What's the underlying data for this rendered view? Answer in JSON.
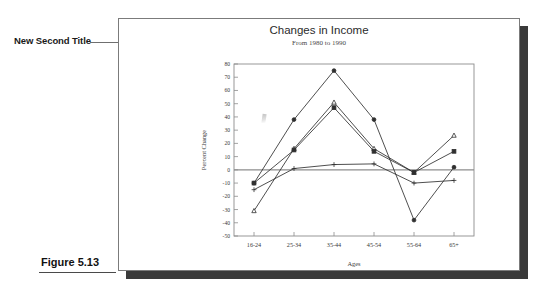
{
  "annotation": {
    "callout_label": "New Second Title"
  },
  "figure": {
    "caption": "Figure 5.13"
  },
  "chart_data": {
    "type": "line",
    "title": "Changes in Income",
    "subtitle": "From 1980 to 1990",
    "xlabel": "Ages",
    "ylabel": "Percent Change",
    "categories": [
      "16-24",
      "25-34",
      "35-44",
      "45-54",
      "55-64",
      "65+"
    ],
    "ylim": [
      -50,
      80
    ],
    "yticks": [
      80,
      70,
      60,
      50,
      40,
      30,
      20,
      10,
      0,
      -10,
      -20,
      -30,
      -40,
      -50
    ],
    "grid": false,
    "legend": "none",
    "series": [
      {
        "name": "Series 1",
        "marker": "circle-filled",
        "values": [
          -10,
          38,
          75,
          38,
          -38,
          2
        ]
      },
      {
        "name": "Series 2",
        "marker": "triangle-open",
        "values": [
          -31,
          16,
          51,
          16,
          -2,
          26
        ]
      },
      {
        "name": "Series 3",
        "marker": "square-filled",
        "values": [
          -10,
          15,
          47,
          14,
          -2,
          14
        ]
      },
      {
        "name": "Series 4",
        "marker": "plus",
        "values": [
          -15,
          1,
          4,
          4.5,
          -10,
          -8
        ]
      }
    ],
    "colors": {
      "line": "#2f2f2f",
      "axis": "#8d8d8d",
      "text": "#3a3a3a"
    }
  }
}
